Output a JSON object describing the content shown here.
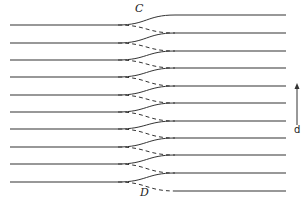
{
  "diagram": {
    "labels": {
      "top_junction": "C",
      "bottom_junction": "D",
      "arrow": "d"
    },
    "left_lines_y": [
      25,
      43,
      60,
      77,
      95,
      112,
      129,
      147,
      164,
      182
    ],
    "right_lines_y": [
      15,
      33,
      51,
      68,
      86,
      103,
      121,
      138,
      155,
      173,
      191
    ],
    "left_x": [
      10,
      118
    ],
    "right_x": [
      175,
      286
    ],
    "line_color": "#333333",
    "arrow": {
      "x": 297,
      "y_from": 125,
      "y_to": 83
    }
  }
}
